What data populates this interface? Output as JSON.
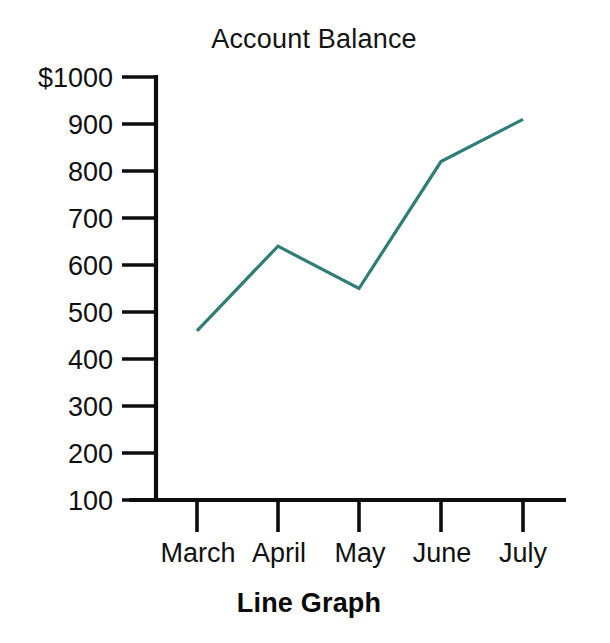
{
  "figure": {
    "title": "Account Balance",
    "caption": "Line Graph",
    "background_color": "#ffffff",
    "axis_color": "#0d0d0d",
    "text_color": "#111111"
  },
  "chart_data": {
    "type": "line",
    "title": "Account Balance",
    "caption": "Line Graph",
    "xlabel": "",
    "ylabel": "",
    "categories": [
      "March",
      "April",
      "May",
      "June",
      "July"
    ],
    "values": [
      460,
      640,
      550,
      820,
      910
    ],
    "series": [
      {
        "name": "Account Balance",
        "color": "#2e7d77",
        "values": [
          460,
          640,
          550,
          820,
          910
        ]
      }
    ],
    "ylim": [
      100,
      1000
    ],
    "ytick_values": [
      100,
      200,
      300,
      400,
      500,
      600,
      700,
      800,
      900,
      1000
    ],
    "ytick_labels": [
      "100",
      "200",
      "300",
      "400",
      "500",
      "600",
      "700",
      "800",
      "900",
      "$1000"
    ],
    "xtick_labels": [
      "March",
      "April",
      "May",
      "June",
      "July"
    ],
    "grid": false,
    "legend": false,
    "currency_symbol": "$"
  }
}
